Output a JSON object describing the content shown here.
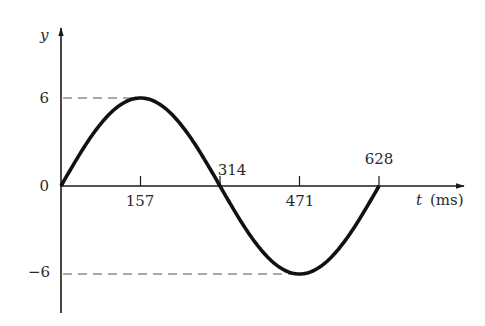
{
  "chart_data": {
    "type": "line",
    "title": "",
    "xlabel": "t (ms)",
    "xlabel_var": "t",
    "xlabel_unit": "(ms)",
    "ylabel": "y",
    "x_ticks": [
      157,
      314,
      471,
      628
    ],
    "x_tick_labels": [
      "157",
      "314",
      "471",
      "628"
    ],
    "y_ticks": [
      6,
      0,
      -6
    ],
    "y_tick_labels": [
      "6",
      "0",
      "−6"
    ],
    "xlim": [
      0,
      750
    ],
    "ylim": [
      -7.9,
      9.5
    ],
    "grid": false,
    "legend": null,
    "series": [
      {
        "name": "y(t) = 6 sin(t/100)",
        "x": [
          0,
          39,
          78.5,
          118,
          157,
          196,
          235.5,
          275,
          314,
          353,
          392.5,
          432,
          471,
          510,
          549.5,
          589,
          628
        ],
        "values": [
          0,
          2.3,
          4.24,
          5.54,
          6,
          5.54,
          4.24,
          2.3,
          0,
          -2.3,
          -4.24,
          -5.54,
          -6,
          -5.54,
          -4.24,
          -2.3,
          0
        ]
      }
    ],
    "annotations": [
      {
        "type": "dashed-hline",
        "y": 6,
        "x_from": 0,
        "x_to": 157
      },
      {
        "type": "dashed-hline",
        "y": -6,
        "x_from": 0,
        "x_to": 471
      }
    ],
    "colors": {
      "curve": "#111111",
      "axis": "#1a1a1a",
      "dash": "#555555"
    }
  }
}
